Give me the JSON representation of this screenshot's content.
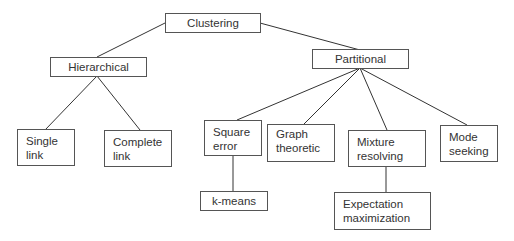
{
  "diagram": {
    "type": "tree",
    "nodes": {
      "root": {
        "label": "Clustering"
      },
      "hierarchical": {
        "label": "Hierarchical"
      },
      "partitional": {
        "label": "Partitional"
      },
      "single_link": {
        "line1": "Single",
        "line2": "link"
      },
      "complete_link": {
        "line1": "Complete",
        "line2": "link"
      },
      "square_error": {
        "line1": "Square",
        "line2": "error"
      },
      "graph_theoretic": {
        "line1": "Graph",
        "line2": "theoretic"
      },
      "mixture_resolving": {
        "line1": "Mixture",
        "line2": "resolving"
      },
      "mode_seeking": {
        "line1": "Mode",
        "line2": "seeking"
      },
      "k_means": {
        "label": "k-means"
      },
      "expectation_maximization": {
        "line1": "Expectation",
        "line2": "maximization"
      }
    },
    "edges": [
      [
        "Clustering",
        "Hierarchical"
      ],
      [
        "Clustering",
        "Partitional"
      ],
      [
        "Hierarchical",
        "Single link"
      ],
      [
        "Hierarchical",
        "Complete link"
      ],
      [
        "Partitional",
        "Square error"
      ],
      [
        "Partitional",
        "Graph theoretic"
      ],
      [
        "Partitional",
        "Mixture resolving"
      ],
      [
        "Partitional",
        "Mode seeking"
      ],
      [
        "Square error",
        "k-means"
      ],
      [
        "Mixture resolving",
        "Expectation maximization"
      ]
    ],
    "colors": {
      "line": "#333333",
      "border": "#555555",
      "text": "#333333",
      "background": "#ffffff"
    }
  }
}
